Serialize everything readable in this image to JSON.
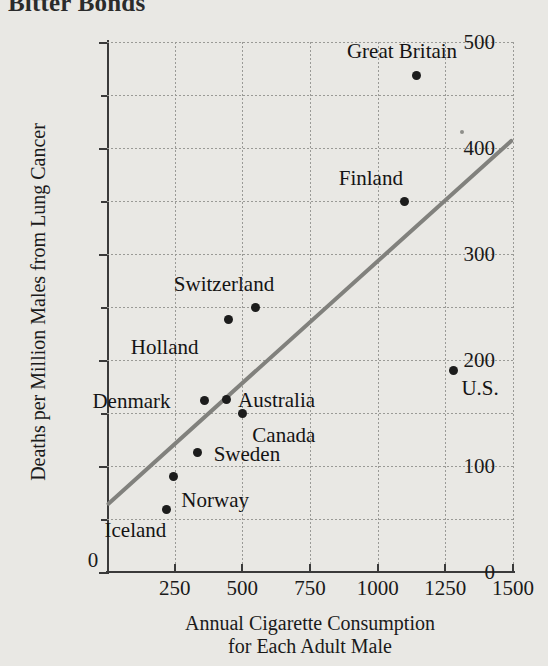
{
  "figure": {
    "title": "Bitter Bonds",
    "background_color": "#e9e8e4",
    "ink_color": "#1c1c1c",
    "trend_line_color": "#81817d"
  },
  "chart_data": {
    "type": "scatter",
    "title": "Bitter Bonds",
    "xlabel_line1": "Annual Cigarette Consumption",
    "xlabel_line2": "for Each Adult Male",
    "ylabel": "Deaths per Million Males from Lung Cancer",
    "xlim": [
      0,
      1500
    ],
    "ylim": [
      0,
      500
    ],
    "xticks": [
      0,
      250,
      500,
      750,
      1000,
      1250,
      1500
    ],
    "yticks": [
      0,
      100,
      200,
      300,
      400,
      500
    ],
    "y_minor_ticks": [
      50,
      150,
      250,
      350,
      450
    ],
    "grid": true,
    "legend": "none",
    "points": [
      {
        "label": "Iceland",
        "x": 220,
        "y": 59,
        "label_dx": -62,
        "label_dy": 22
      },
      {
        "label": "Norway",
        "x": 245,
        "y": 90,
        "label_dx": 8,
        "label_dy": 24
      },
      {
        "label": "Sweden",
        "x": 335,
        "y": 113,
        "label_dx": 16,
        "label_dy": 3
      },
      {
        "label": "Canada",
        "x": 500,
        "y": 150,
        "label_dx": 10,
        "label_dy": 23
      },
      {
        "label": "Denmark",
        "x": 360,
        "y": 162,
        "label_dx": -112,
        "label_dy": 2
      },
      {
        "label": "Australia",
        "x": 440,
        "y": 163,
        "label_dx": 12,
        "label_dy": 2
      },
      {
        "label": "U.S.",
        "x": 1280,
        "y": 190,
        "label_dx": 8,
        "label_dy": 18
      },
      {
        "label": "Holland",
        "x": 450,
        "y": 238,
        "label_dx": -98,
        "label_dy": 28
      },
      {
        "label": "Switzerland",
        "x": 550,
        "y": 250,
        "label_dx": -82,
        "label_dy": -22
      },
      {
        "label": "Finland",
        "x": 1100,
        "y": 350,
        "label_dx": -66,
        "label_dy": -22
      },
      {
        "label": "Great Britain",
        "x": 1145,
        "y": 468,
        "label_dx": -70,
        "label_dy": -24
      }
    ],
    "trend_line": {
      "x_start": 0,
      "y_start": 63,
      "x_end": 1500,
      "y_end": 408
    }
  }
}
